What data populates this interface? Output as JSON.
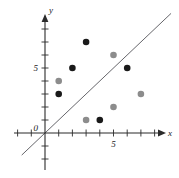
{
  "chart_data": {
    "type": "scatter",
    "title": "",
    "xlabel": "x",
    "ylabel": "y",
    "xlim": [
      -2,
      9
    ],
    "ylim": [
      -3,
      9
    ],
    "grid": false,
    "legend": null,
    "x_tick_labels": [
      {
        "value": 5,
        "label": "5"
      }
    ],
    "y_tick_labels": [
      {
        "value": 5,
        "label": "5"
      }
    ],
    "origin_label": "0",
    "tick_interval": 1,
    "series": [
      {
        "name": "black-points",
        "color": "#1a1a1a",
        "marker": "filled-circle",
        "points": [
          {
            "x": 1,
            "y": 3
          },
          {
            "x": 2,
            "y": 5
          },
          {
            "x": 3,
            "y": 7
          },
          {
            "x": 4,
            "y": 1
          },
          {
            "x": 6,
            "y": 5
          }
        ]
      },
      {
        "name": "gray-points",
        "color": "#8c8c8c",
        "marker": "filled-circle",
        "points": [
          {
            "x": 1,
            "y": 4
          },
          {
            "x": 3,
            "y": 1
          },
          {
            "x": 5,
            "y": 6
          },
          {
            "x": 5,
            "y": 2
          },
          {
            "x": 7,
            "y": 3
          }
        ]
      }
    ],
    "reference_line": {
      "name": "identity-line",
      "equation": "y = x",
      "color": "#55555a",
      "from": {
        "x": -1.7,
        "y": -1.7
      },
      "to": {
        "x": 9.2,
        "y": 9.2
      }
    },
    "axis_color": "#2b2b2b",
    "background_color": "#ffffff"
  }
}
